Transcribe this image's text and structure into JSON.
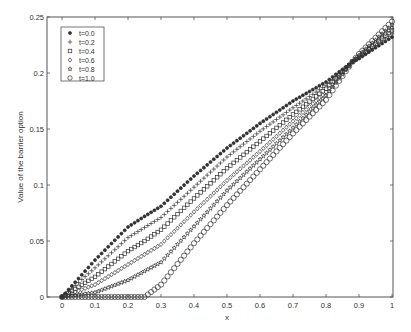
{
  "chart_data": {
    "type": "scatter",
    "title": "",
    "xlabel": "x",
    "ylabel": "Value of the barrier option",
    "xlim": [
      0,
      1
    ],
    "ylim": [
      0,
      0.25
    ],
    "grid": false,
    "legend_position": "upper-left",
    "x_ticks": [
      "0",
      "0.1",
      "0.2",
      "0.3",
      "0.4",
      "0.5",
      "0.6",
      "0.7",
      "0.8",
      "0.9",
      "1"
    ],
    "y_ticks": [
      "0",
      "0.05",
      "0.1",
      "0.15",
      "0.2",
      "0.25"
    ],
    "x": [
      0,
      0.1,
      0.2,
      0.25,
      0.3,
      0.4,
      0.5,
      0.6,
      0.7,
      0.8,
      0.88,
      0.9,
      1.0
    ],
    "series": [
      {
        "name": "t=0.0",
        "marker": "asterisk",
        "values": [
          0,
          0.033,
          0.0625,
          0.072,
          0.081,
          0.108,
          0.133,
          0.155,
          0.175,
          0.192,
          0.21,
          0.213,
          0.232
        ]
      },
      {
        "name": "t=0.2",
        "marker": "plus",
        "values": [
          0,
          0.026,
          0.053,
          0.062,
          0.071,
          0.098,
          0.125,
          0.148,
          0.169,
          0.189,
          0.21,
          0.213,
          0.235
        ]
      },
      {
        "name": "t=0.4",
        "marker": "square",
        "values": [
          0,
          0.018,
          0.041,
          0.05,
          0.06,
          0.088,
          0.115,
          0.139,
          0.163,
          0.186,
          0.21,
          0.214,
          0.238
        ]
      },
      {
        "name": "t=0.6",
        "marker": "diamond",
        "values": [
          0,
          0.011,
          0.029,
          0.038,
          0.047,
          0.076,
          0.104,
          0.13,
          0.157,
          0.183,
          0.21,
          0.215,
          0.24
        ]
      },
      {
        "name": "t=0.8",
        "marker": "pentagram",
        "values": [
          0,
          0.004,
          0.015,
          0.023,
          0.031,
          0.063,
          0.095,
          0.123,
          0.151,
          0.18,
          0.21,
          0.216,
          0.243
        ]
      },
      {
        "name": "t=1.0",
        "marker": "circle",
        "values": [
          0,
          0,
          0,
          0,
          0.011,
          0.048,
          0.082,
          0.114,
          0.146,
          0.176,
          0.21,
          0.217,
          0.246
        ]
      }
    ]
  },
  "colors": {
    "axis": "#555555",
    "marker": "#333333",
    "background": "#ffffff"
  }
}
